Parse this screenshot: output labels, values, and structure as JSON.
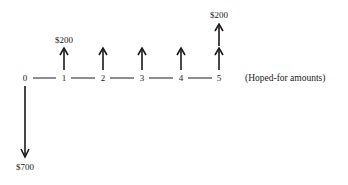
{
  "diagram": {
    "type": "cash-flow-timeline",
    "periods": [
      "0",
      "1",
      "2",
      "3",
      "4",
      "5"
    ],
    "outflow": {
      "period": "0",
      "amount_label": "$700",
      "direction": "down"
    },
    "inflows": [
      {
        "period": "1",
        "amount_label": "$200",
        "direction": "up"
      },
      {
        "period": "2",
        "amount_label": "",
        "direction": "up"
      },
      {
        "period": "3",
        "amount_label": "",
        "direction": "up"
      },
      {
        "period": "4",
        "amount_label": "",
        "direction": "up"
      },
      {
        "period": "5",
        "amount_label": "",
        "direction": "up"
      },
      {
        "period": "5",
        "amount_label": "$200",
        "direction": "up",
        "stacked": true
      }
    ],
    "note": "(Hoped-for amounts)",
    "colors": {
      "ink": "#1a1a1a",
      "background": "#ffffff"
    }
  }
}
